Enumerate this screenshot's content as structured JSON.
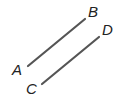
{
  "diagram": {
    "segments": [
      {
        "name": "AB",
        "from": "A",
        "to": "B",
        "x1": 28,
        "y1": 66,
        "x2": 85,
        "y2": 19
      },
      {
        "name": "CD",
        "from": "C",
        "to": "D",
        "x1": 42,
        "y1": 84,
        "x2": 99,
        "y2": 37
      }
    ],
    "points": [
      {
        "label": "A",
        "x": 12,
        "y": 75
      },
      {
        "label": "B",
        "x": 88,
        "y": 17
      },
      {
        "label": "C",
        "x": 26,
        "y": 94
      },
      {
        "label": "D",
        "x": 102,
        "y": 35
      }
    ],
    "line_color": "#555555"
  }
}
